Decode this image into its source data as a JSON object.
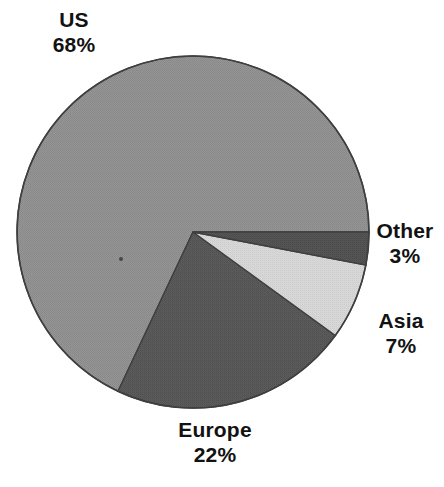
{
  "chart_data": {
    "type": "pie",
    "title": "",
    "subtitle": "",
    "xlabel": "",
    "ylabel": "",
    "categories": [
      "US",
      "Europe",
      "Asia",
      "Other"
    ],
    "values": [
      68,
      22,
      7,
      3
    ],
    "unit": "%",
    "total": 100,
    "legend": "none",
    "grid": false,
    "labels_inline": true,
    "start_angle_deg": 0,
    "direction": "clockwise",
    "center": {
      "x": 193,
      "y": 232
    },
    "radius": 176,
    "slices": [
      {
        "name": "US",
        "value": 68,
        "value_text": "68%",
        "color": "#939393",
        "start_deg": 115.2,
        "end_deg": 360.0,
        "label_position": "top-left"
      },
      {
        "name": "Europe",
        "value": 22,
        "value_text": "22%",
        "color": "#5a5a5a",
        "start_deg": 36.0,
        "end_deg": 115.2,
        "label_position": "bottom"
      },
      {
        "name": "Asia",
        "value": 7,
        "value_text": "7%",
        "color": "#d5d5d5",
        "start_deg": 10.8,
        "end_deg": 36.0,
        "label_position": "right-lower"
      },
      {
        "name": "Other",
        "value": 3,
        "value_text": "3%",
        "color": "#555555",
        "start_deg": 0.0,
        "end_deg": 10.8,
        "label_position": "right-upper"
      }
    ],
    "outline_color": "#3f3f3f",
    "background": "#ffffff"
  },
  "labels": {
    "us": {
      "name": "US",
      "value": "68%"
    },
    "europe": {
      "name": "Europe",
      "value": "22%"
    },
    "asia": {
      "name": "Asia",
      "value": "7%"
    },
    "other": {
      "name": "Other",
      "value": "3%"
    }
  }
}
